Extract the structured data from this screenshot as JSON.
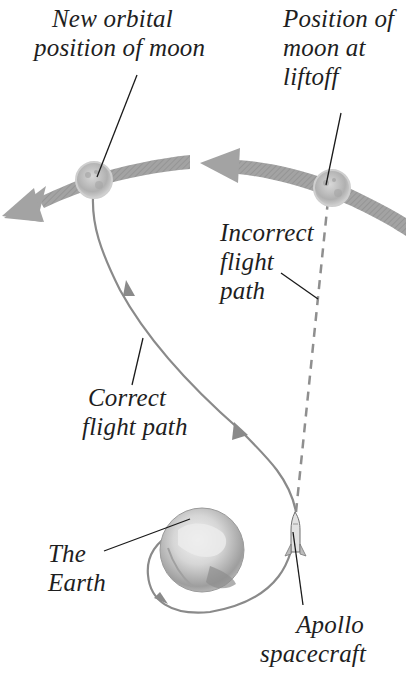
{
  "diagram": {
    "colors": {
      "orbit_arrow": "#9a9a9a",
      "flight_path": "#8a8a8a",
      "leader_line": "#1a1a1a",
      "moon": "#b9b9b9",
      "earth": "#c8c8c8",
      "text": "#1e1e1e",
      "background": "#ffffff"
    },
    "labels": {
      "new_moon_position": {
        "line1": "New orbital",
        "line2": "position of moon"
      },
      "moon_at_liftoff": {
        "line1": "Position of",
        "line2": "moon at",
        "line3": "liftoff"
      },
      "incorrect_path": {
        "line1": "Incorrect",
        "line2": "flight",
        "line3": "path"
      },
      "correct_path": {
        "line1": "Correct",
        "line2": "flight path"
      },
      "earth": {
        "line1": "The",
        "line2": "Earth"
      },
      "spacecraft": {
        "line1": "Apollo",
        "line2": "spacecraft"
      }
    },
    "icons": {
      "moon_new": "moon-icon",
      "moon_liftoff": "moon-icon",
      "earth": "earth-globe-icon",
      "spacecraft": "rocket-icon",
      "orbit_arrow_left": "orbit-arrow-icon",
      "orbit_arrow_right": "orbit-arrow-icon"
    }
  }
}
